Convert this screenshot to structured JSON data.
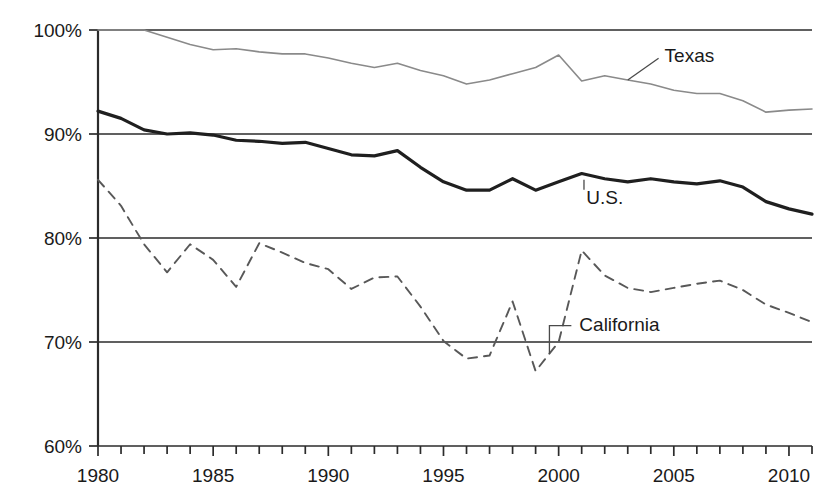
{
  "chart_data": {
    "type": "line",
    "title": "",
    "subtitle": "",
    "xlabel": "",
    "ylabel": "",
    "xlim": [
      1980,
      2011
    ],
    "ylim": [
      60,
      100
    ],
    "y_tick_labels": [
      "100%",
      "90%",
      "80%",
      "70%",
      "60%"
    ],
    "y_tick_values": [
      100,
      90,
      80,
      70,
      60
    ],
    "x_tick_labels": [
      "1980",
      "1985",
      "1990",
      "1995",
      "2000",
      "2005",
      "2010"
    ],
    "x_tick_values": [
      1980,
      1985,
      1990,
      1995,
      2000,
      2005,
      2010
    ],
    "x_minor_ticks": [
      1980,
      1981,
      1982,
      1983,
      1984,
      1985,
      1986,
      1987,
      1988,
      1989,
      1990,
      1991,
      1992,
      1993,
      1994,
      1995,
      1996,
      1997,
      1998,
      1999,
      2000,
      2001,
      2002,
      2003,
      2004,
      2005,
      2006,
      2007,
      2008,
      2009,
      2010,
      2011
    ],
    "grid": "horizontal",
    "legend_position": "inline-annotations",
    "x": [
      1980,
      1981,
      1982,
      1983,
      1984,
      1985,
      1986,
      1987,
      1988,
      1989,
      1990,
      1991,
      1992,
      1993,
      1994,
      1995,
      1996,
      1997,
      1998,
      1999,
      2000,
      2001,
      2002,
      2003,
      2004,
      2005,
      2006,
      2007,
      2008,
      2009,
      2010,
      2011
    ],
    "series": [
      {
        "name": "Texas",
        "style": "solid-thin",
        "color": "#8a8a8a",
        "width": 1.6,
        "label": "Texas",
        "label_x": 2004.6,
        "label_y": 96.9,
        "leader_from_x": 2003.0,
        "leader_from_y": 95.2,
        "values": [
          100.0,
          100.0,
          100.0,
          99.3,
          98.6,
          98.1,
          98.2,
          97.9,
          97.7,
          97.7,
          97.3,
          96.8,
          96.4,
          96.8,
          96.1,
          95.6,
          94.8,
          95.2,
          95.8,
          96.4,
          97.6,
          95.1,
          95.6,
          95.2,
          94.8,
          94.2,
          93.9,
          93.9,
          93.2,
          92.1,
          92.3,
          92.4
        ]
      },
      {
        "name": "U.S.",
        "style": "solid-bold",
        "color": "#1f1f1f",
        "width": 3.2,
        "label": "U.S.",
        "label_x": 2001.2,
        "label_y": 83.3,
        "leader_from_x": 2001.1,
        "leader_from_y": 85.6,
        "values": [
          92.2,
          91.5,
          90.4,
          90.0,
          90.1,
          89.9,
          89.4,
          89.3,
          89.1,
          89.2,
          88.6,
          88.0,
          87.9,
          88.4,
          86.8,
          85.4,
          84.6,
          84.6,
          85.7,
          84.6,
          85.4,
          86.2,
          85.7,
          85.4,
          85.7,
          85.4,
          85.2,
          85.5,
          84.9,
          83.5,
          82.8,
          82.3
        ]
      },
      {
        "name": "California",
        "style": "dashed",
        "color": "#585858",
        "width": 1.9,
        "label": "California",
        "label_x": 2000.9,
        "label_y": 71.1,
        "leader_from_x": 1999.6,
        "leader_from_y": 69.9,
        "values": [
          85.6,
          83.1,
          79.4,
          76.7,
          79.4,
          77.9,
          75.3,
          79.5,
          78.6,
          77.6,
          77.0,
          75.1,
          76.2,
          76.3,
          73.4,
          70.1,
          68.4,
          68.7,
          73.9,
          67.2,
          70.0,
          78.8,
          76.4,
          75.2,
          74.8,
          75.2,
          75.6,
          75.9,
          75.0,
          73.6,
          72.8,
          71.9
        ]
      }
    ]
  },
  "geometry": {
    "plot_left": 98,
    "plot_right": 812,
    "plot_top": 30,
    "plot_bottom": 446
  }
}
